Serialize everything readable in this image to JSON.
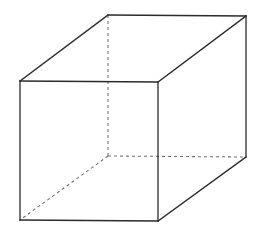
{
  "figure": {
    "shape_name": "cube",
    "projection": "oblique",
    "canvas": {
      "width": 265,
      "height": 233
    },
    "background_color": "#ffffff",
    "solid_edge_color": "#2b2b2b",
    "hidden_edge_color": "#6e6e6e",
    "solid_edge_width": 1.3,
    "hidden_edge_width": 1.05,
    "hidden_dash_pattern": "3 3",
    "vertices": {
      "front_top_left": {
        "x": 20,
        "y": 81
      },
      "front_top_right": {
        "x": 158,
        "y": 82
      },
      "front_bottom_left": {
        "x": 20,
        "y": 220
      },
      "front_bottom_right": {
        "x": 158,
        "y": 221
      },
      "back_top_left": {
        "x": 108,
        "y": 15
      },
      "back_top_right": {
        "x": 246,
        "y": 16
      },
      "back_bottom_left": {
        "x": 108,
        "y": 156
      },
      "back_bottom_right": {
        "x": 246,
        "y": 157
      }
    },
    "edges": [
      {
        "name": "front-top-edge",
        "from": "front_top_left",
        "to": "front_top_right",
        "style": "solid",
        "points": "20,81 158,82"
      },
      {
        "name": "front-right-edge",
        "from": "front_top_right",
        "to": "front_bottom_right",
        "style": "solid",
        "points": "158,82 158,221"
      },
      {
        "name": "front-bottom-edge",
        "from": "front_bottom_right",
        "to": "front_bottom_left",
        "style": "solid",
        "points": "158,221 20,220"
      },
      {
        "name": "front-left-edge",
        "from": "front_bottom_left",
        "to": "front_top_left",
        "style": "solid",
        "points": "20,220 20,81"
      },
      {
        "name": "back-top-edge",
        "from": "back_top_left",
        "to": "back_top_right",
        "style": "solid",
        "points": "108,15 246,16"
      },
      {
        "name": "back-right-edge",
        "from": "back_top_right",
        "to": "back_bottom_right",
        "style": "solid",
        "points": "246,16 246,157"
      },
      {
        "name": "top-left-depth-edge",
        "from": "front_top_left",
        "to": "back_top_left",
        "style": "solid",
        "points": "20,81 108,15"
      },
      {
        "name": "top-right-depth-edge",
        "from": "front_top_right",
        "to": "back_top_right",
        "style": "solid",
        "points": "158,82 246,16"
      },
      {
        "name": "bottom-right-depth-edge",
        "from": "front_bottom_right",
        "to": "back_bottom_right",
        "style": "solid",
        "points": "158,221 246,157"
      },
      {
        "name": "hidden-vertical-edge",
        "from": "back_top_left",
        "to": "back_bottom_left",
        "style": "dashed",
        "points": "108,15 108,156"
      },
      {
        "name": "hidden-back-bottom-edge",
        "from": "back_bottom_left",
        "to": "back_bottom_right",
        "style": "dashed",
        "points": "108,156 246,157"
      },
      {
        "name": "hidden-depth-edge",
        "from": "back_bottom_left",
        "to": "front_bottom_left",
        "style": "dashed",
        "points": "108,156 20,220"
      }
    ],
    "faces": [
      {
        "name": "front-face",
        "visible": true,
        "polygon": "20,81 158,82 158,221 20,220"
      },
      {
        "name": "top-face",
        "visible": true,
        "polygon": "20,81 108,15 246,16 158,82"
      },
      {
        "name": "right-face",
        "visible": true,
        "polygon": "158,82 246,16 246,157 158,221"
      },
      {
        "name": "back-face",
        "visible": false,
        "polygon": "108,15 246,16 246,157 108,156"
      },
      {
        "name": "left-face",
        "visible": false,
        "polygon": "20,81 108,15 108,156 20,220"
      },
      {
        "name": "bottom-face",
        "visible": false,
        "polygon": "20,220 158,221 246,157 108,156"
      }
    ]
  }
}
